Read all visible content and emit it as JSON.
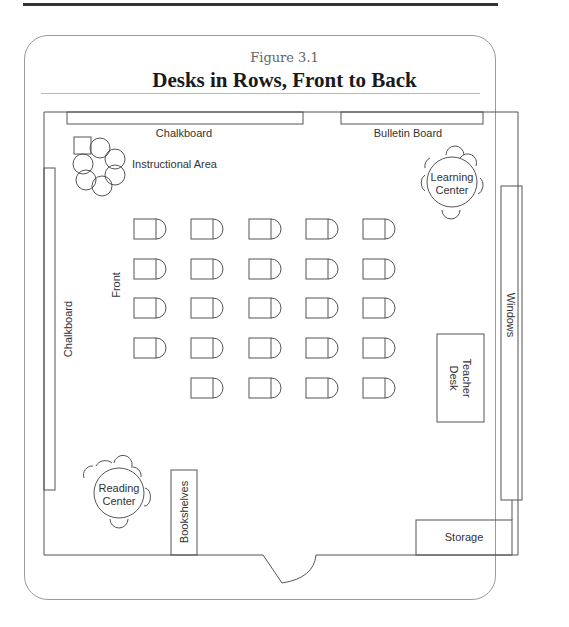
{
  "figure": {
    "number": "Figure 3.1",
    "title": "Desks in Rows, Front to Back"
  },
  "room": {
    "labels": {
      "chalkboard_top": "Chalkboard",
      "bulletin_board": "Bulletin Board",
      "instructional_area": "Instructional Area",
      "learning_center_line1": "Learning",
      "learning_center_line2": "Center",
      "chalkboard_left": "Chalkboard",
      "front": "Front",
      "windows": "Windows",
      "teacher_desk_line1": "Teacher",
      "teacher_desk_line2": "Desk",
      "reading_center_line1": "Reading",
      "reading_center_line2": "Center",
      "bookshelves": "Bookshelves",
      "storage": "Storage"
    },
    "desk_grid": {
      "rows": 5,
      "columns": 5,
      "row_desk_counts": [
        5,
        5,
        5,
        5,
        4
      ],
      "total_desks": 24,
      "facing": "left (toward Front)"
    }
  }
}
